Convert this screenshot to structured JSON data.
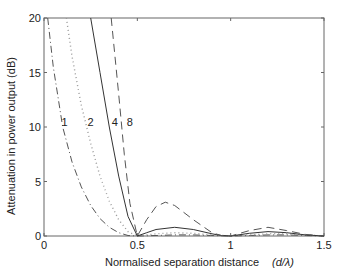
{
  "chart_data": {
    "type": "line",
    "title": "",
    "xlabel": "Normalised separation distance",
    "xlabel_unit": "(d/λ)",
    "ylabel": "Attenuation in power output (dB)",
    "xlim": [
      0,
      1.5
    ],
    "ylim": [
      0,
      20
    ],
    "x_ticks": [
      "0",
      "0.5",
      "1",
      "1.5"
    ],
    "y_ticks": [
      "0",
      "5",
      "10",
      "15",
      "20"
    ],
    "grid": false,
    "legend": "inline labels",
    "series": [
      {
        "name": "1",
        "style": "dash-dot",
        "x": [
          0.02,
          0.05,
          0.1,
          0.15,
          0.2,
          0.25,
          0.3,
          0.35,
          0.4,
          0.45,
          0.5,
          0.6,
          0.7,
          0.8,
          0.9,
          1.0,
          1.1,
          1.2,
          1.3,
          1.4,
          1.5
        ],
        "y": [
          20,
          15.5,
          10,
          6.8,
          4.5,
          2.8,
          1.6,
          0.8,
          0.3,
          0.05,
          0,
          0.05,
          0.1,
          0.1,
          0.05,
          0,
          0.05,
          0.1,
          0.1,
          0.05,
          0
        ]
      },
      {
        "name": "2",
        "style": "dotted",
        "x": [
          0.12,
          0.15,
          0.2,
          0.25,
          0.3,
          0.35,
          0.4,
          0.45,
          0.5,
          0.6,
          0.7,
          0.8,
          0.9,
          1.0,
          1.1,
          1.2,
          1.3,
          1.4,
          1.5
        ],
        "y": [
          20,
          16.5,
          12,
          8.5,
          5.5,
          3.2,
          1.5,
          0.4,
          0,
          0.2,
          0.3,
          0.25,
          0.1,
          0,
          0.1,
          0.2,
          0.2,
          0.1,
          0
        ]
      },
      {
        "name": "4",
        "style": "solid",
        "x": [
          0.25,
          0.3,
          0.35,
          0.4,
          0.45,
          0.5,
          0.55,
          0.6,
          0.7,
          0.8,
          0.9,
          0.95,
          1.0,
          1.1,
          1.2,
          1.3,
          1.4,
          1.5
        ],
        "y": [
          20,
          15,
          10,
          5.5,
          1.8,
          0,
          0.3,
          0.6,
          0.8,
          0.6,
          0.2,
          0.05,
          0,
          0.25,
          0.4,
          0.3,
          0.1,
          0
        ]
      },
      {
        "name": "8",
        "style": "dashed",
        "x": [
          0.36,
          0.4,
          0.43,
          0.46,
          0.5,
          0.55,
          0.6,
          0.65,
          0.7,
          0.8,
          0.9,
          0.95,
          1.0,
          1.1,
          1.2,
          1.3,
          1.4,
          1.5
        ],
        "y": [
          20,
          13,
          7.5,
          3,
          0,
          1.5,
          2.7,
          3.1,
          2.8,
          1.5,
          0.3,
          0.05,
          0,
          0.5,
          0.8,
          0.5,
          0.15,
          0
        ]
      }
    ],
    "annotations": [
      {
        "text": "1",
        "x": 0.11,
        "y": 10.5
      },
      {
        "text": "2",
        "x": 0.25,
        "y": 10.5
      },
      {
        "text": "4",
        "x": 0.38,
        "y": 10.5
      },
      {
        "text": "8",
        "x": 0.46,
        "y": 10.5
      }
    ]
  }
}
